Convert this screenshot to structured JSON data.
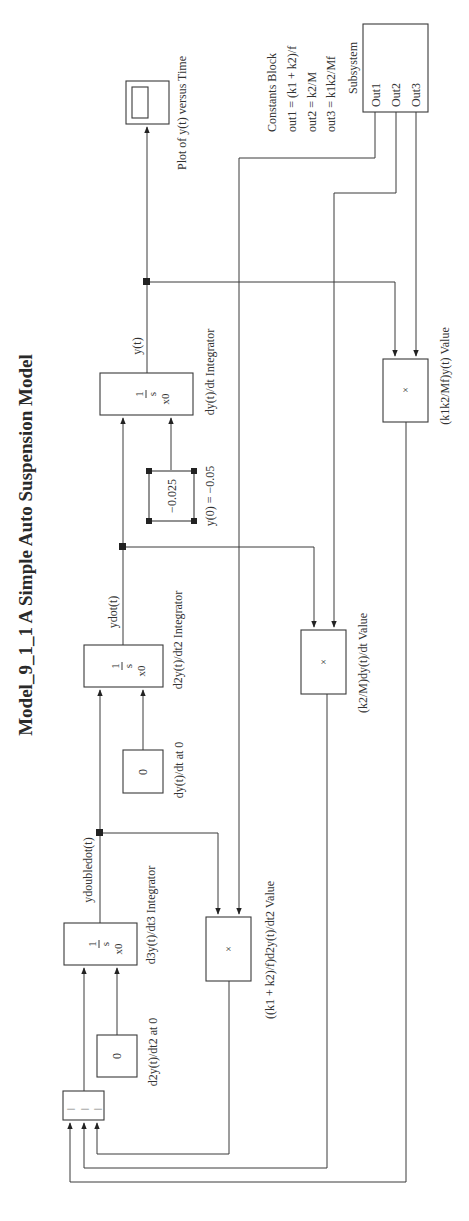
{
  "title": "Model_9_1_1 A Simple Auto Suspension Model",
  "colors": {
    "line": "#3a3a3a",
    "text": "#333333",
    "background": "#ffffff"
  },
  "blocks": {
    "sum": {
      "signs": [
        "|",
        "|",
        "|"
      ]
    },
    "const_d2y": {
      "value": "0",
      "label": "d2y(t)/dt2 at 0"
    },
    "int_d3y": {
      "num": "1",
      "den": "s",
      "ic": "x0",
      "label": "d3y(t)/dt3 Integrator",
      "output": "ydoubledot(t)"
    },
    "const_dy": {
      "value": "0",
      "label": "dy(t)/dt at 0"
    },
    "int_d2y": {
      "num": "1",
      "den": "s",
      "ic": "x0",
      "label": "d2y(t)/dt2 Integrator",
      "output": "ydot(t)"
    },
    "const_y0": {
      "value": "−0.025",
      "label": "y(0) = −0.05"
    },
    "int_dy": {
      "num": "1",
      "den": "s",
      "ic": "x0",
      "label": "dy(t)/dt Integrator",
      "output": "y(t)"
    },
    "prod1": {
      "symbol": "×",
      "label": "((k1 + k2)/f)d2y(t)/dt2 Value"
    },
    "prod2": {
      "symbol": "×",
      "label": "(k2/M)dy(t)/dt Value"
    },
    "prod3": {
      "symbol": "×",
      "label": "(k1k2/Mf)y(t) Value"
    },
    "scope": {
      "label": "Plot of y(t) versus Time"
    },
    "subsystem": {
      "title": "Subsystem",
      "ports": [
        "Out1",
        "Out2",
        "Out3"
      ],
      "description": [
        "Constants Block",
        "out1 = (k1 + k2)/f",
        "out2 = k2/M",
        "out3 = k1k2/Mf"
      ]
    }
  }
}
